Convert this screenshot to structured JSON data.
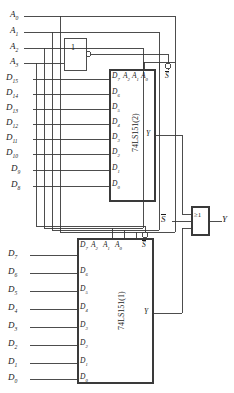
{
  "diagram": {
    "line_color": "#3a3a3a",
    "text_color": "#1a1a1a",
    "background": "#ffffff"
  },
  "address_inputs": [
    {
      "name": "A0",
      "base": "A",
      "sub": "0"
    },
    {
      "name": "A1",
      "base": "A",
      "sub": "1"
    },
    {
      "name": "A2",
      "base": "A",
      "sub": "2"
    },
    {
      "name": "A3",
      "base": "A",
      "sub": "3"
    }
  ],
  "inverter": {
    "label": "1",
    "name": "inverter-gate",
    "bubble": true
  },
  "or_gate": {
    "label": "≥1",
    "name": "or-gate",
    "output_label": "Y",
    "output_base": "Y"
  },
  "strobe": {
    "label": "S",
    "overline": true,
    "name": "strobe-input"
  },
  "upper_chip": {
    "part": "74LS151(2)",
    "output_label": "Y",
    "top_pins": [
      {
        "label": "D7",
        "base": "D",
        "sub": "7"
      },
      {
        "label": "A2",
        "base": "A",
        "sub": "2"
      },
      {
        "label": "A1",
        "base": "A",
        "sub": "1"
      },
      {
        "label": "A0",
        "base": "A",
        "sub": "0"
      },
      {
        "label": "S",
        "base": "S",
        "sub": "",
        "overline": true
      }
    ],
    "data_inputs": [
      {
        "external": "D15",
        "ext_base": "D",
        "ext_sub": "15",
        "pin": "D7",
        "pin_base": "D",
        "pin_sub": "7"
      },
      {
        "external": "D14",
        "ext_base": "D",
        "ext_sub": "14",
        "pin": "D6",
        "pin_base": "D",
        "pin_sub": "6"
      },
      {
        "external": "D13",
        "ext_base": "D",
        "ext_sub": "13",
        "pin": "D5",
        "pin_base": "D",
        "pin_sub": "5"
      },
      {
        "external": "D12",
        "ext_base": "D",
        "ext_sub": "12",
        "pin": "D4",
        "pin_base": "D",
        "pin_sub": "4"
      },
      {
        "external": "D11",
        "ext_base": "D",
        "ext_sub": "11",
        "pin": "D3",
        "pin_base": "D",
        "pin_sub": "3"
      },
      {
        "external": "D10",
        "ext_base": "D",
        "ext_sub": "10",
        "pin": "D2",
        "pin_base": "D",
        "pin_sub": "2"
      },
      {
        "external": "D9",
        "ext_base": "D",
        "ext_sub": "9",
        "pin": "D1",
        "pin_base": "D",
        "pin_sub": "1"
      },
      {
        "external": "D8",
        "ext_base": "D",
        "ext_sub": "8",
        "pin": "D0",
        "pin_base": "D",
        "pin_sub": "0"
      }
    ]
  },
  "lower_chip": {
    "part": "74LS151(1)",
    "output_label": "Y",
    "top_pins": [
      {
        "label": "D7",
        "base": "D",
        "sub": "7"
      },
      {
        "label": "A2",
        "base": "A",
        "sub": "2"
      },
      {
        "label": "A1",
        "base": "A",
        "sub": "1"
      },
      {
        "label": "A0",
        "base": "A",
        "sub": "0"
      },
      {
        "label": "S",
        "base": "S",
        "sub": "",
        "overline": true
      }
    ],
    "data_inputs": [
      {
        "external": "D7",
        "ext_base": "D",
        "ext_sub": "7",
        "pin": "D7",
        "pin_base": "D",
        "pin_sub": "7"
      },
      {
        "external": "D6",
        "ext_base": "D",
        "ext_sub": "6",
        "pin": "D6",
        "pin_base": "D",
        "pin_sub": "6"
      },
      {
        "external": "D5",
        "ext_base": "D",
        "ext_sub": "5",
        "pin": "D5",
        "pin_base": "D",
        "pin_sub": "5"
      },
      {
        "external": "D4",
        "ext_base": "D",
        "ext_sub": "4",
        "pin": "D4",
        "pin_base": "D",
        "pin_sub": "4"
      },
      {
        "external": "D3",
        "ext_base": "D",
        "ext_sub": "3",
        "pin": "D3",
        "pin_base": "D",
        "pin_sub": "3"
      },
      {
        "external": "D2",
        "ext_base": "D",
        "ext_sub": "2",
        "pin": "D2",
        "pin_base": "D",
        "pin_sub": "2"
      },
      {
        "external": "D1",
        "ext_base": "D",
        "ext_sub": "1",
        "pin": "D1",
        "pin_base": "D",
        "pin_sub": "1"
      },
      {
        "external": "D0",
        "ext_base": "D",
        "ext_sub": "0",
        "pin": "D0",
        "pin_base": "D",
        "pin_sub": "0"
      }
    ]
  }
}
